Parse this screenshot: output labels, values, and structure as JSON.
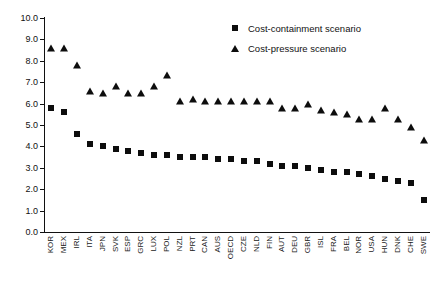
{
  "chart_data": {
    "type": "scatter",
    "title": "",
    "xlabel": "",
    "ylabel": "",
    "ylim": [
      0.0,
      10.0
    ],
    "ytick_step": 1.0,
    "grid": false,
    "legend_position": "top-right",
    "ytick_labels": [
      "10.0",
      "9.0",
      "8.0",
      "7.0",
      "6.0",
      "5.0",
      "4.0",
      "3.0",
      "2.0",
      "1.0",
      "0.0"
    ],
    "categories": [
      "KOR",
      "MEX",
      "IRL",
      "ITA",
      "JPN",
      "SVK",
      "ESP",
      "GRC",
      "LUX",
      "POL",
      "NZL",
      "PRT",
      "CAN",
      "AUS",
      "OECD",
      "CZE",
      "NLD",
      "FIN",
      "AUT",
      "DEU",
      "GBR",
      "ISL",
      "FRA",
      "BEL",
      "NOR",
      "USA",
      "HUN",
      "DNK",
      "CHE",
      "SWE"
    ],
    "series": [
      {
        "name": "Cost-containment scenario",
        "marker": "square",
        "color": "#0d0d0d",
        "values": [
          5.8,
          5.6,
          4.6,
          4.1,
          4.0,
          3.9,
          3.8,
          3.7,
          3.6,
          3.6,
          3.5,
          3.5,
          3.5,
          3.4,
          3.4,
          3.3,
          3.3,
          3.2,
          3.1,
          3.1,
          3.0,
          2.9,
          2.8,
          2.8,
          2.7,
          2.6,
          2.5,
          2.4,
          2.3,
          1.5
        ]
      },
      {
        "name": "Cost-pressure scenario",
        "marker": "triangle",
        "color": "#0d0d0d",
        "values": [
          8.6,
          8.6,
          7.8,
          6.6,
          6.5,
          6.8,
          6.5,
          6.5,
          6.8,
          7.35,
          6.1,
          6.2,
          6.1,
          6.1,
          6.1,
          6.1,
          6.1,
          6.1,
          5.8,
          5.8,
          6.0,
          5.7,
          5.6,
          5.5,
          5.3,
          5.3,
          5.8,
          5.3,
          4.9,
          4.3
        ]
      }
    ]
  },
  "legend": {
    "items": [
      {
        "label": "Cost-containment scenario",
        "marker": "square"
      },
      {
        "label": "Cost-pressure scenario",
        "marker": "triangle"
      }
    ]
  }
}
